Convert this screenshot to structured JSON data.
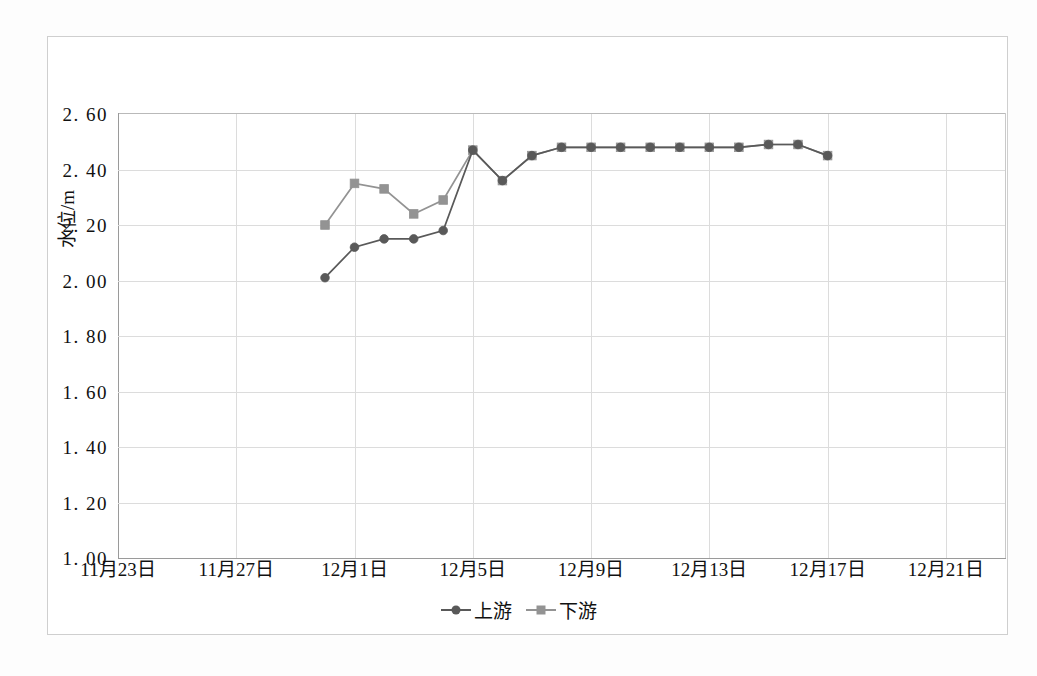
{
  "chart_data": {
    "type": "line",
    "title": "",
    "xlabel": "",
    "ylabel": "水位/m",
    "ylim": [
      1.0,
      2.6
    ],
    "ytick_step": 0.2,
    "ytick_labels": [
      "2. 60",
      "2. 40",
      "2. 20",
      "2. 00",
      "1. 80",
      "1. 60",
      "1. 40",
      "1. 20",
      "1. 00"
    ],
    "ytick_values": [
      2.6,
      2.4,
      2.2,
      2.0,
      1.8,
      1.6,
      1.4,
      1.2,
      1.0
    ],
    "xtick_labels": [
      "11月23日",
      "11月27日",
      "12月1日",
      "12月5日",
      "12月9日",
      "12月13日",
      "12月17日",
      "12月21日"
    ],
    "xtick_day_index": [
      0,
      4,
      8,
      12,
      16,
      20,
      24,
      28
    ],
    "x_day_min": 0,
    "x_day_max": 30,
    "grid": "both",
    "legend_position": "bottom-center",
    "series": [
      {
        "name": "上游",
        "marker": "circle",
        "color": "#595959",
        "x_days": [
          7,
          8,
          9,
          10,
          11,
          12,
          13,
          14,
          15,
          16,
          17,
          18,
          19,
          20,
          21,
          22,
          23,
          24
        ],
        "x_dates": [
          "11月30日",
          "12月1日",
          "12月2日",
          "12月3日",
          "12月4日",
          "12月5日",
          "12月6日",
          "12月7日",
          "12月8日",
          "12月9日",
          "12月10日",
          "12月11日",
          "12月12日",
          "12月13日",
          "12月14日",
          "12月15日",
          "12月16日",
          "12月17日"
        ],
        "values": [
          2.01,
          2.12,
          2.15,
          2.15,
          2.18,
          2.47,
          2.36,
          2.45,
          2.48,
          2.48,
          2.48,
          2.48,
          2.48,
          2.48,
          2.48,
          2.49,
          2.49,
          2.45
        ]
      },
      {
        "name": "下游",
        "marker": "square",
        "color": "#939393",
        "x_days": [
          7,
          8,
          9,
          10,
          11,
          12,
          13,
          14,
          15,
          16,
          17,
          18,
          19,
          20,
          21,
          22,
          23,
          24
        ],
        "x_dates": [
          "11月30日",
          "12月1日",
          "12月2日",
          "12月3日",
          "12月4日",
          "12月5日",
          "12月6日",
          "12月7日",
          "12月8日",
          "12月9日",
          "12月10日",
          "12月11日",
          "12月12日",
          "12月13日",
          "12月14日",
          "12月15日",
          "12月16日",
          "12月17日"
        ],
        "values": [
          2.2,
          2.35,
          2.33,
          2.24,
          2.29,
          2.47,
          2.36,
          2.45,
          2.48,
          2.48,
          2.48,
          2.48,
          2.48,
          2.48,
          2.48,
          2.49,
          2.49,
          2.45
        ]
      }
    ]
  },
  "legend": {
    "items": [
      {
        "label": "上游",
        "color": "#595959",
        "marker": "circle"
      },
      {
        "label": "下游",
        "color": "#939393",
        "marker": "square"
      }
    ]
  },
  "axis": {
    "y_title": "水位/m"
  }
}
